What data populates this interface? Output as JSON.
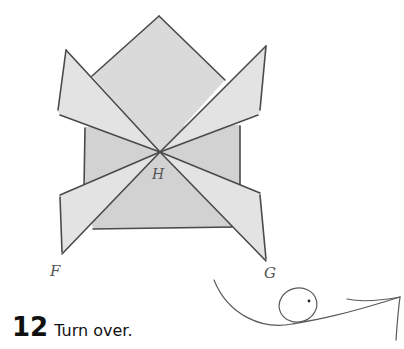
{
  "step": {
    "number": "12",
    "instruction": "Turn over."
  },
  "labels": {
    "left_flap": "F",
    "right_flap": "G",
    "center": "H"
  },
  "icons": {
    "turn_over": "turn-over-arrow-icon"
  },
  "colors": {
    "paper": "#d8d8d8",
    "pencil_line": "#4a4a4a",
    "text": "#111111"
  }
}
